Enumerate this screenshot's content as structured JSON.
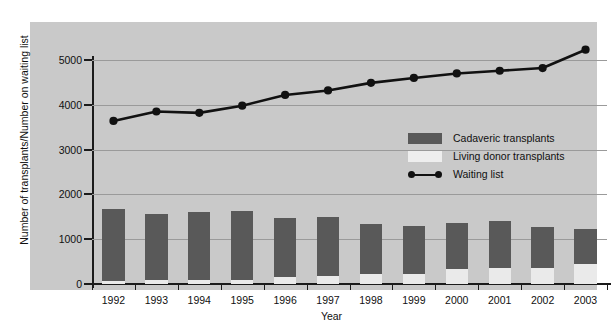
{
  "chart_data": {
    "type": "bar",
    "title": "",
    "xlabel": "Year",
    "ylabel": "Number of transplants/Number on waiting list",
    "ylim": [
      0,
      5000
    ],
    "yticks": [
      0,
      1000,
      2000,
      3000,
      4000,
      5000
    ],
    "grid": true,
    "legend_position": "inside-center-right",
    "categories": [
      "1992",
      "1993",
      "1994",
      "1995",
      "1996",
      "1997",
      "1998",
      "1999",
      "2000",
      "2001",
      "2002",
      "2003"
    ],
    "series": [
      {
        "name": "Cadaveric transplants",
        "type": "bar-stacked",
        "color": "#595959",
        "values": [
          1600,
          1480,
          1520,
          1540,
          1320,
          1330,
          1110,
          1060,
          1030,
          1060,
          920,
          780
        ]
      },
      {
        "name": "Living donor transplants",
        "type": "bar-stacked",
        "color": "#eaeaea",
        "values": [
          70,
          80,
          90,
          100,
          150,
          170,
          220,
          230,
          330,
          350,
          360,
          440
        ]
      },
      {
        "name": "Waiting list",
        "type": "line",
        "color": "#111111",
        "values": [
          3640,
          3850,
          3820,
          3980,
          4220,
          4320,
          4490,
          4600,
          4700,
          4760,
          4820,
          5230
        ]
      }
    ]
  },
  "legend": {
    "items": [
      {
        "label": "Cadaveric transplants"
      },
      {
        "label": "Living donor transplants"
      },
      {
        "label": "Waiting list"
      }
    ]
  },
  "axes": {
    "y_title": "Number of transplants/Number on waiting list",
    "x_title": "Year",
    "y_tick_labels": [
      "0",
      "1000",
      "2000",
      "3000",
      "4000",
      "5000"
    ],
    "x_tick_labels": [
      "1992",
      "1993",
      "1994",
      "1995",
      "1996",
      "1997",
      "1998",
      "1999",
      "2000",
      "2001",
      "2002",
      "2003"
    ]
  },
  "colors": {
    "panel_background": "#c9c9c9",
    "page_background": "#ffffff",
    "cadaveric": "#595959",
    "living_donor": "#eaeaea",
    "waiting_line": "#111111",
    "axis": "#1b1b1b",
    "gridline": "#9a9a9a"
  }
}
